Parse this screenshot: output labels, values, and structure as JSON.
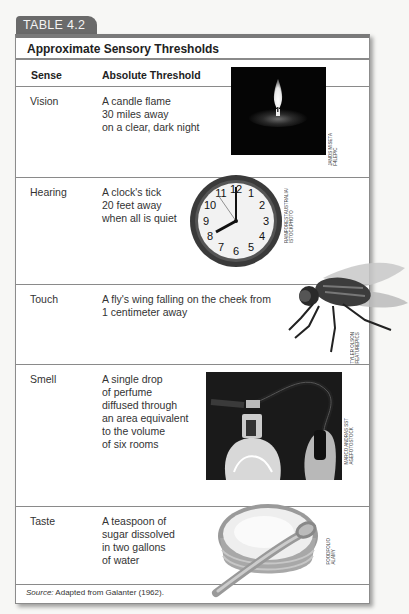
{
  "tab_label": "TABLE 4.2",
  "title": "Approximate Sensory Thresholds",
  "columns": [
    "Sense",
    "Absolute Threshold"
  ],
  "rows": [
    {
      "sense": "Vision",
      "threshold": "A candle flame\n30 miles away\non a clear, dark night",
      "image": "candle-flame-photo",
      "credit": "JANOS MISETA\nF4LEPIC"
    },
    {
      "sense": "Hearing",
      "threshold": "A clock's tick\n20 feet away\nwhen all is quiet",
      "image": "wall-clock-photo",
      "credit": "RAINFORESTAUSTRALIA/\nISTOCKPHOTO"
    },
    {
      "sense": "Touch",
      "threshold": "A fly's wing falling on the cheek from\n1 centimeter away",
      "image": "housefly-photo",
      "credit": "TYLER OLSON\nFEATUREPICS"
    },
    {
      "sense": "Smell",
      "threshold": "A single drop\nof perfume\ndiffused through\nan area equivalent\nto the volume\nof six rooms",
      "image": "perfume-atomizer-photo",
      "credit": "MARCO ANDRAS SST\nAGEFOTOSTOCK"
    },
    {
      "sense": "Taste",
      "threshold": "A teaspoon of\nsugar dissolved\nin two gallons\nof water",
      "image": "sugar-bowl-spoon-photo",
      "credit": "FOODFOLIO\nALAMY"
    }
  ],
  "source": {
    "label": "Source:",
    "text": " Adapted from Galanter (1962)."
  },
  "colors": {
    "tab_bg": "#6a6a6a",
    "border": "#8a8a8a",
    "page_bg": "#f7f7f5"
  },
  "clock": {
    "numerals": [
      "12",
      "1",
      "2",
      "3",
      "4",
      "5",
      "6",
      "7",
      "8",
      "9",
      "10",
      "11"
    ],
    "time": "8:00"
  }
}
